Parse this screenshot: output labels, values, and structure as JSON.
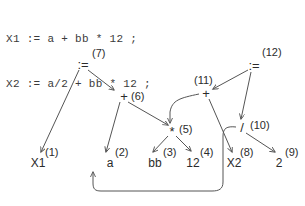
{
  "code": {
    "lines": [
      "X1 := a + bb * 12 ;",
      "X2 := a/2 + bb * 12 ;"
    ],
    "line1": "X1 := a + bb * 12 ;",
    "line2": "X2 := a/2 + bb * 12 ;"
  },
  "diagram": {
    "type": "dag",
    "stroke_color": "#555555",
    "text_color": "#2b2b2b",
    "background": "#ffffff",
    "nodes": [
      {
        "id": "n7",
        "label": ":=",
        "number": "(7)",
        "kind": "operator",
        "x": 83,
        "y": 64
      },
      {
        "id": "n6",
        "label": "+",
        "number": "(6)",
        "kind": "operator",
        "x": 124,
        "y": 96
      },
      {
        "id": "n5",
        "label": "*",
        "number": "(5)",
        "kind": "operator",
        "x": 172,
        "y": 131
      },
      {
        "id": "n12",
        "label": ":=",
        "number": "(12)",
        "kind": "operator",
        "x": 254,
        "y": 65
      },
      {
        "id": "n11",
        "label": "+",
        "number": "(11)",
        "kind": "operator",
        "x": 206,
        "y": 93
      },
      {
        "id": "n10",
        "label": "/",
        "number": "(10)",
        "kind": "operator",
        "x": 242,
        "y": 127
      },
      {
        "id": "l1",
        "label": "X1",
        "number": "(1)",
        "kind": "leaf",
        "x": 38,
        "y": 163
      },
      {
        "id": "l2",
        "label": "a",
        "number": "(2)",
        "kind": "leaf",
        "x": 110,
        "y": 163
      },
      {
        "id": "l3",
        "label": "bb",
        "number": "(3)",
        "kind": "leaf",
        "x": 155,
        "y": 163
      },
      {
        "id": "l4",
        "label": "12",
        "number": "(4)",
        "kind": "leaf",
        "x": 193,
        "y": 163
      },
      {
        "id": "l8",
        "label": "X2",
        "number": "(8)",
        "kind": "leaf",
        "x": 234,
        "y": 163
      },
      {
        "id": "l9",
        "label": "2",
        "number": "(9)",
        "kind": "leaf",
        "x": 279,
        "y": 163
      }
    ],
    "edges": [
      {
        "from": "n7",
        "to": "l1",
        "style": "straight"
      },
      {
        "from": "n7",
        "to": "n6",
        "style": "straight"
      },
      {
        "from": "n6",
        "to": "l2",
        "style": "straight"
      },
      {
        "from": "n6",
        "to": "n5",
        "style": "straight"
      },
      {
        "from": "n5",
        "to": "l3",
        "style": "straight"
      },
      {
        "from": "n5",
        "to": "l4",
        "style": "straight"
      },
      {
        "from": "n12",
        "to": "n11",
        "style": "straight"
      },
      {
        "from": "n12",
        "to": "n10",
        "style": "straight"
      },
      {
        "from": "n11",
        "to": "n5",
        "style": "curved"
      },
      {
        "from": "n11",
        "to": "l8",
        "style": "straight"
      },
      {
        "from": "n10",
        "to": "l9",
        "style": "straight"
      },
      {
        "from": "n10",
        "to": "l2",
        "style": "curved"
      }
    ]
  }
}
